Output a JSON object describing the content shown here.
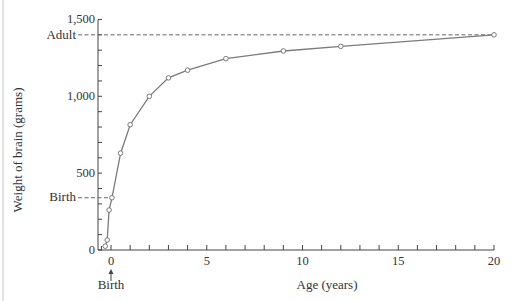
{
  "chart_data": {
    "type": "line",
    "title": "",
    "xlabel": "Age (years)",
    "ylabel": "Weight of brain (grams)",
    "xlim": [
      -0.7,
      20
    ],
    "ylim": [
      0,
      1500
    ],
    "x_ticks": [
      0,
      5,
      10,
      15,
      20
    ],
    "x_tick_labels": [
      "0",
      "5",
      "10",
      "15",
      "20"
    ],
    "x_minor_step": 1,
    "y_ticks": [
      0,
      500,
      1000,
      1500
    ],
    "y_tick_labels": [
      "0",
      "500",
      "1,000",
      "1,500"
    ],
    "y_minor_step": 100,
    "grid": false,
    "legend": null,
    "series": [
      {
        "name": "Brain weight",
        "x": [
          -0.3,
          -0.2,
          -0.1,
          0.05,
          0.5,
          1,
          2,
          3,
          4,
          6,
          9,
          12,
          20
        ],
        "y": [
          25,
          65,
          260,
          340,
          630,
          815,
          1000,
          1120,
          1170,
          1245,
          1295,
          1325,
          1400
        ],
        "color": "#777777",
        "marker": "open-circle"
      }
    ],
    "annotations": [
      {
        "label": "Adult",
        "type": "horizontal-dashed-reference",
        "y": 1400
      },
      {
        "label": "Birth",
        "type": "horizontal-dashed-reference",
        "y": 340
      },
      {
        "label": "Birth",
        "type": "arrow-below-x-axis",
        "x": 0
      }
    ]
  },
  "labels": {
    "xlabel": "Age (years)",
    "ylabel": "Weight of brain (grams)",
    "adult": "Adult",
    "birth_y": "Birth",
    "birth_x": "Birth",
    "arrow": "↑"
  },
  "colors": {
    "axis": "#444444",
    "line": "#7a7a7a",
    "dash": "#666666",
    "text": "#333333",
    "frame": "#bbbbbb"
  }
}
